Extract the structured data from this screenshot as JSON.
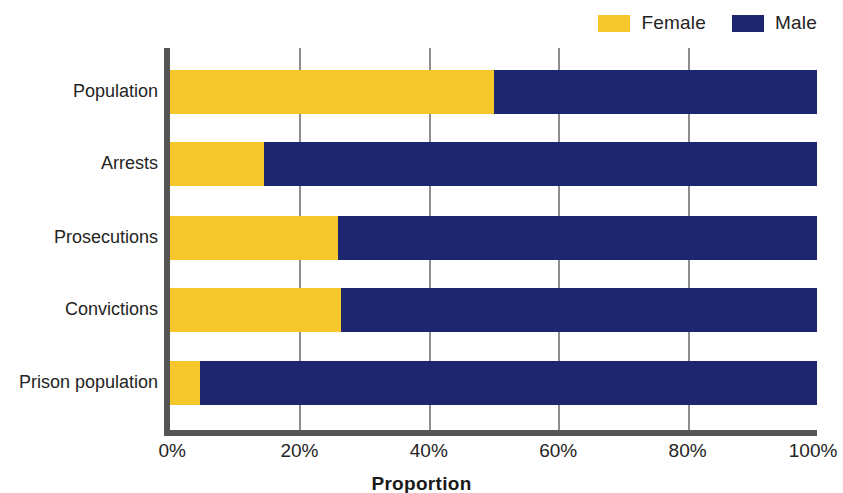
{
  "chart_data": {
    "type": "bar",
    "orientation": "horizontal",
    "stacked": true,
    "normalized": true,
    "title": "",
    "xlabel": "Proportion",
    "ylabel": "",
    "xlim": [
      0,
      100
    ],
    "xticks": [
      "0%",
      "20%",
      "40%",
      "60%",
      "80%",
      "100%"
    ],
    "xtick_values": [
      0,
      20,
      40,
      60,
      80,
      100
    ],
    "grid": true,
    "grid_axis": "x",
    "legend_position": "top-right",
    "categories": [
      "Population",
      "Arrests",
      "Prosecutions",
      "Convictions",
      "Prison population"
    ],
    "series": [
      {
        "name": "Female",
        "color": "#F5C72B",
        "values": [
          50,
          14.5,
          26,
          26.5,
          4.7
        ]
      },
      {
        "name": "Male",
        "color": "#1E2670",
        "values": [
          50,
          85.5,
          74,
          73.5,
          95.3
        ]
      }
    ]
  },
  "legend": {
    "entries": [
      {
        "label": "Female",
        "color": "#F5C72B"
      },
      {
        "label": "Male",
        "color": "#1E2670"
      }
    ]
  },
  "axis": {
    "title": "Proportion"
  },
  "colors": {
    "female": "#F5C72B",
    "male": "#1E2670",
    "axis": "#555555",
    "grid": "#8d8d8d",
    "text": "#242424",
    "background": "#ffffff"
  }
}
